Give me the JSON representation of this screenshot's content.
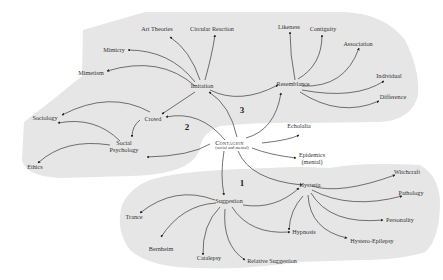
{
  "diagram": {
    "center": {
      "label": "Contagion",
      "sublabel": "(social and mental)"
    },
    "region_numbers": [
      "1",
      "2",
      "3"
    ],
    "colors": {
      "region_fill": "#e6e6e6",
      "edge": "#3a3a3a",
      "text": "#333333"
    },
    "nodes": {
      "imitation": "Imitation",
      "resemblance": "Resemblance",
      "crowd": "Crowd",
      "sociology": "Sociology",
      "social_psychology": "Social Psychology",
      "ethics": "Ethics",
      "art_theories": "Art Theories",
      "circular_reaction": "Circular Reaction",
      "mimicry": "Mimicry",
      "mimetism": "Mimetism",
      "likeness": "Likeness",
      "contiguity": "Contiguity",
      "association": "Association",
      "individual": "Individual",
      "difference": "Difference",
      "echolalia": "Echolalia",
      "epidemics": "Epidemics",
      "epidemics_sub": "(mental)",
      "hysteria": "Hysteria",
      "suggestion": "Suggestion",
      "witchcraft": "Witchcraft",
      "pathology": "Pathology",
      "personality": "Personality",
      "hystero_epilepsy": "Hystero-Epilepsy",
      "hypnosis": "Hypnosis",
      "trance": "Trance",
      "bernheim": "Bernheim",
      "catalepsy": "Catalepsy",
      "relative_suggestion": "Relative Suggestion"
    },
    "social_line1": "Social",
    "social_line2": "Psychology"
  }
}
